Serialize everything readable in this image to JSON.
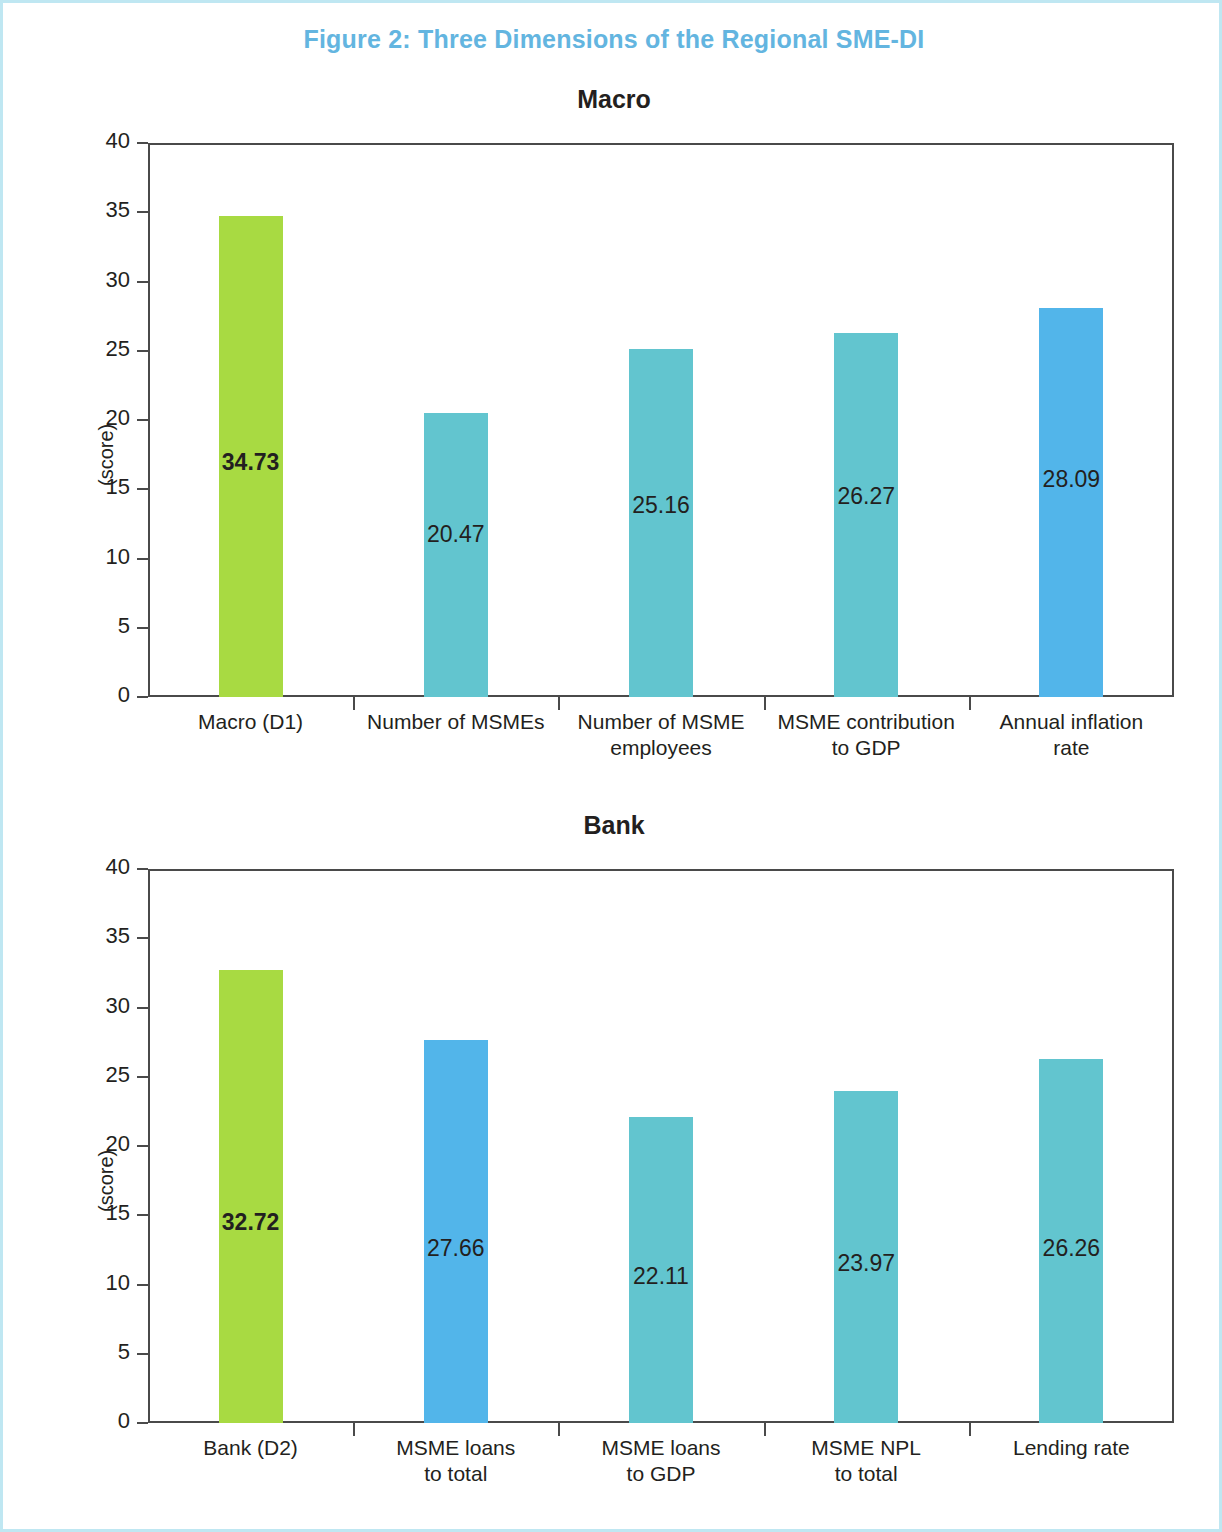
{
  "figure": {
    "title": "Figure 2: Three Dimensions of the Regional SME-DI",
    "title_color": "#63b5e0",
    "border_color": "#bfe7f2"
  },
  "colors": {
    "green": "#a8da42",
    "teal": "#62c5cf",
    "blue": "#52b5ea",
    "axis": "#4a4a4a",
    "text": "#231f20"
  },
  "chart_data": [
    {
      "type": "bar",
      "title": "Macro",
      "xlabel": "",
      "ylabel": "(score)",
      "ylim": [
        0,
        40
      ],
      "yticks": [
        40,
        35,
        30,
        25,
        20,
        15,
        10,
        5,
        0
      ],
      "grid": false,
      "legend": "none",
      "categories": [
        "Macro (D1)",
        "Number of MSMEs",
        "Number of MSME employees",
        "MSME contribution to GDP",
        "Annual inflation rate"
      ],
      "category_lines": [
        [
          "Macro (D1)"
        ],
        [
          "Number of MSMEs"
        ],
        [
          "Number of MSME",
          "employees"
        ],
        [
          "MSME contribution",
          "to GDP"
        ],
        [
          "Annual inflation",
          "rate"
        ]
      ],
      "values": [
        34.73,
        20.47,
        25.16,
        26.27,
        28.09
      ],
      "labels": [
        "34.73",
        "20.47",
        "25.16",
        "26.27",
        "28.09"
      ],
      "bar_colors": [
        "#a8da42",
        "#62c5cf",
        "#62c5cf",
        "#62c5cf",
        "#52b5ea"
      ],
      "label_bold": [
        true,
        false,
        false,
        false,
        false
      ],
      "label_y": [
        16.8,
        11.6,
        13.7,
        14.4,
        15.6
      ]
    },
    {
      "type": "bar",
      "title": "Bank",
      "xlabel": "",
      "ylabel": "(score)",
      "ylim": [
        0,
        40
      ],
      "yticks": [
        40,
        35,
        30,
        25,
        20,
        15,
        10,
        5,
        0
      ],
      "grid": false,
      "legend": "none",
      "categories": [
        "Bank (D2)",
        "MSME loans to total",
        "MSME loans to GDP",
        "MSME NPL to total",
        "Lending rate"
      ],
      "category_lines": [
        [
          "Bank (D2)"
        ],
        [
          "MSME loans",
          "to total"
        ],
        [
          "MSME loans",
          "to GDP"
        ],
        [
          "MSME NPL",
          "to total"
        ],
        [
          "Lending rate"
        ]
      ],
      "values": [
        32.72,
        27.66,
        22.11,
        23.97,
        26.26
      ],
      "labels": [
        "32.72",
        "27.66",
        "22.11",
        "23.97",
        "26.26"
      ],
      "bar_colors": [
        "#a8da42",
        "#52b5ea",
        "#62c5cf",
        "#62c5cf",
        "#62c5cf"
      ],
      "label_bold": [
        true,
        false,
        false,
        false,
        false
      ],
      "label_y": [
        14.4,
        12.5,
        10.5,
        11.4,
        12.5
      ]
    }
  ]
}
